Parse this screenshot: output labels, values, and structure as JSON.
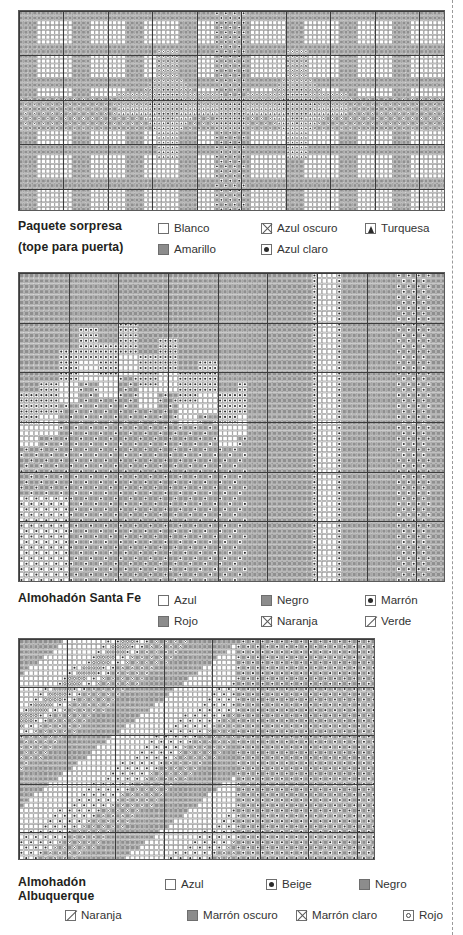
{
  "page": {
    "background": "#ffffff",
    "ink": "#231f20",
    "edge_rule_color": "#9a9a9a"
  },
  "charts": [
    {
      "id": "paquete-sorpresa",
      "title_lines": [
        "Paquete sorpresa",
        "(tope para puerta)"
      ],
      "legend": [
        [
          {
            "symbol": "empty-box",
            "label": "Blanco"
          },
          {
            "symbol": "cross-box",
            "label": "Azul oscuro"
          },
          {
            "symbol": "triangle-box",
            "label": "Turquesa"
          }
        ],
        [
          {
            "symbol": "solid-box",
            "label": "Amarillo"
          },
          {
            "symbol": "dot-box",
            "label": "Azul claro"
          },
          {
            "symbol": "",
            "label": ""
          }
        ]
      ],
      "grid": {
        "cols": 96,
        "rows": 42,
        "cell_px": 4.45
      }
    },
    {
      "id": "almohadon-santa-fe",
      "title_lines": [
        "Almohadón Santa Fe"
      ],
      "legend": [
        [
          {
            "symbol": "empty-box",
            "label": "Azul"
          },
          {
            "symbol": "solid-box",
            "label": "Negro"
          },
          {
            "symbol": "dot-box",
            "label": "Marrón"
          }
        ],
        [
          {
            "symbol": "solid-box",
            "label": "Rojo"
          },
          {
            "symbol": "cross-box",
            "label": "Naranja"
          },
          {
            "symbol": "diag-box",
            "label": "Verde"
          }
        ]
      ],
      "grid": {
        "cols": 86,
        "rows": 57,
        "cell_px": 4.6
      }
    },
    {
      "id": "almohadon-albuquerque",
      "title_lines": [
        "Almohadón Albuquerque"
      ],
      "legend": [
        [
          {
            "symbol": "empty-box",
            "label": "Azul"
          },
          {
            "symbol": "dot-box",
            "label": "Beige"
          },
          {
            "symbol": "solid-box",
            "label": "Negro"
          }
        ],
        [
          {
            "symbol": "diag-box",
            "label": "Naranja"
          },
          {
            "symbol": "solid-box",
            "label": "Marrón oscuro"
          },
          {
            "symbol": "cross-box",
            "label": "Marrón claro"
          },
          {
            "symbol": "ring-box",
            "label": "Rojo"
          }
        ]
      ],
      "grid": {
        "cols": 74,
        "rows": 42,
        "cell_px": 4.6
      }
    }
  ],
  "chart_data": {
    "type": "heatmap",
    "grid": true,
    "legend_position": "below",
    "panels": [
      {
        "name": "Paquete sorpresa (tope para puerta)",
        "cols": 96,
        "rows": 42,
        "symbols": [
          "blank",
          "solid",
          "cross",
          "dot",
          "triangle"
        ],
        "colors": [
          "Blanco",
          "Amarillo",
          "Azul oscuro",
          "Azul claro",
          "Turquesa"
        ],
        "motif": "plaid / tartan field with two eight-point stars and a wide horizontal band plus a vertical band crossing centre"
      },
      {
        "name": "Almohadón Santa Fe",
        "cols": 86,
        "rows": 57,
        "symbols": [
          "blank",
          "solid",
          "dot",
          "cross",
          "diag"
        ],
        "colors": [
          "Azul",
          "Negro",
          "Marrón",
          "Rojo",
          "Naranja",
          "Verde"
        ],
        "motif": "stepped southwestern mountain silhouette on dense field with two vertical stripes at right"
      },
      {
        "name": "Almohadón Albuquerque",
        "cols": 74,
        "rows": 42,
        "symbols": [
          "blank",
          "dot",
          "solid",
          "diag",
          "cross",
          "ring"
        ],
        "colors": [
          "Azul",
          "Beige",
          "Negro",
          "Naranja",
          "Marrón oscuro",
          "Marrón claro",
          "Rojo"
        ],
        "motif": "broad diagonal bands with stepped terraces running lower-left to upper-right"
      }
    ]
  }
}
